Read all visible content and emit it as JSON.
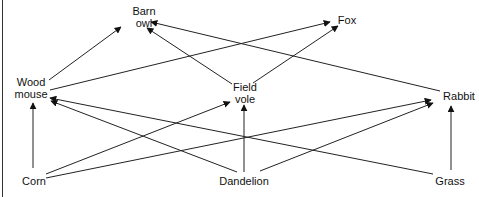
{
  "diagram": {
    "type": "food-web",
    "nodes": [
      {
        "id": "barn_owl",
        "label_lines": [
          "Barn",
          "owl"
        ],
        "x": 144,
        "y": 17
      },
      {
        "id": "fox",
        "label_lines": [
          "Fox"
        ],
        "x": 347,
        "y": 20
      },
      {
        "id": "wood_mouse",
        "label_lines": [
          "Wood",
          "mouse"
        ],
        "x": 31,
        "y": 88
      },
      {
        "id": "field_vole",
        "label_lines": [
          "Field",
          "vole"
        ],
        "x": 245,
        "y": 93
      },
      {
        "id": "rabbit",
        "label_lines": [
          "Rabbit"
        ],
        "x": 459,
        "y": 96
      },
      {
        "id": "corn",
        "label_lines": [
          "Corn"
        ],
        "x": 34,
        "y": 181
      },
      {
        "id": "dandelion",
        "label_lines": [
          "Dandelion"
        ],
        "x": 244,
        "y": 181
      },
      {
        "id": "grass",
        "label_lines": [
          "Grass"
        ],
        "x": 450,
        "y": 181
      }
    ],
    "edges": [
      {
        "from": "wood_mouse",
        "to": "barn_owl",
        "x1": 49,
        "y1": 80,
        "x2": 121,
        "y2": 27
      },
      {
        "from": "wood_mouse",
        "to": "fox",
        "x1": 50,
        "y1": 90,
        "x2": 330,
        "y2": 22
      },
      {
        "from": "field_vole",
        "to": "barn_owl",
        "x1": 232,
        "y1": 84,
        "x2": 147,
        "y2": 28
      },
      {
        "from": "field_vole",
        "to": "fox",
        "x1": 253,
        "y1": 83,
        "x2": 338,
        "y2": 26
      },
      {
        "from": "rabbit",
        "to": "barn_owl",
        "x1": 440,
        "y1": 91,
        "x2": 151,
        "y2": 22
      },
      {
        "from": "corn",
        "to": "wood_mouse",
        "x1": 33,
        "y1": 168,
        "x2": 33,
        "y2": 103
      },
      {
        "from": "corn",
        "to": "field_vole",
        "x1": 46,
        "y1": 174,
        "x2": 230,
        "y2": 102
      },
      {
        "from": "corn",
        "to": "rabbit",
        "x1": 46,
        "y1": 178,
        "x2": 431,
        "y2": 100
      },
      {
        "from": "dandelion",
        "to": "wood_mouse",
        "x1": 237,
        "y1": 172,
        "x2": 51,
        "y2": 101
      },
      {
        "from": "dandelion",
        "to": "field_vole",
        "x1": 244,
        "y1": 172,
        "x2": 244,
        "y2": 105
      },
      {
        "from": "dandelion",
        "to": "rabbit",
        "x1": 260,
        "y1": 171,
        "x2": 433,
        "y2": 103
      },
      {
        "from": "grass",
        "to": "wood_mouse",
        "x1": 433,
        "y1": 174,
        "x2": 50,
        "y2": 98
      },
      {
        "from": "grass",
        "to": "rabbit",
        "x1": 451,
        "y1": 170,
        "x2": 451,
        "y2": 106
      }
    ],
    "colors": {
      "line": "#222222",
      "text": "#111111",
      "background": "#ffffff"
    }
  }
}
